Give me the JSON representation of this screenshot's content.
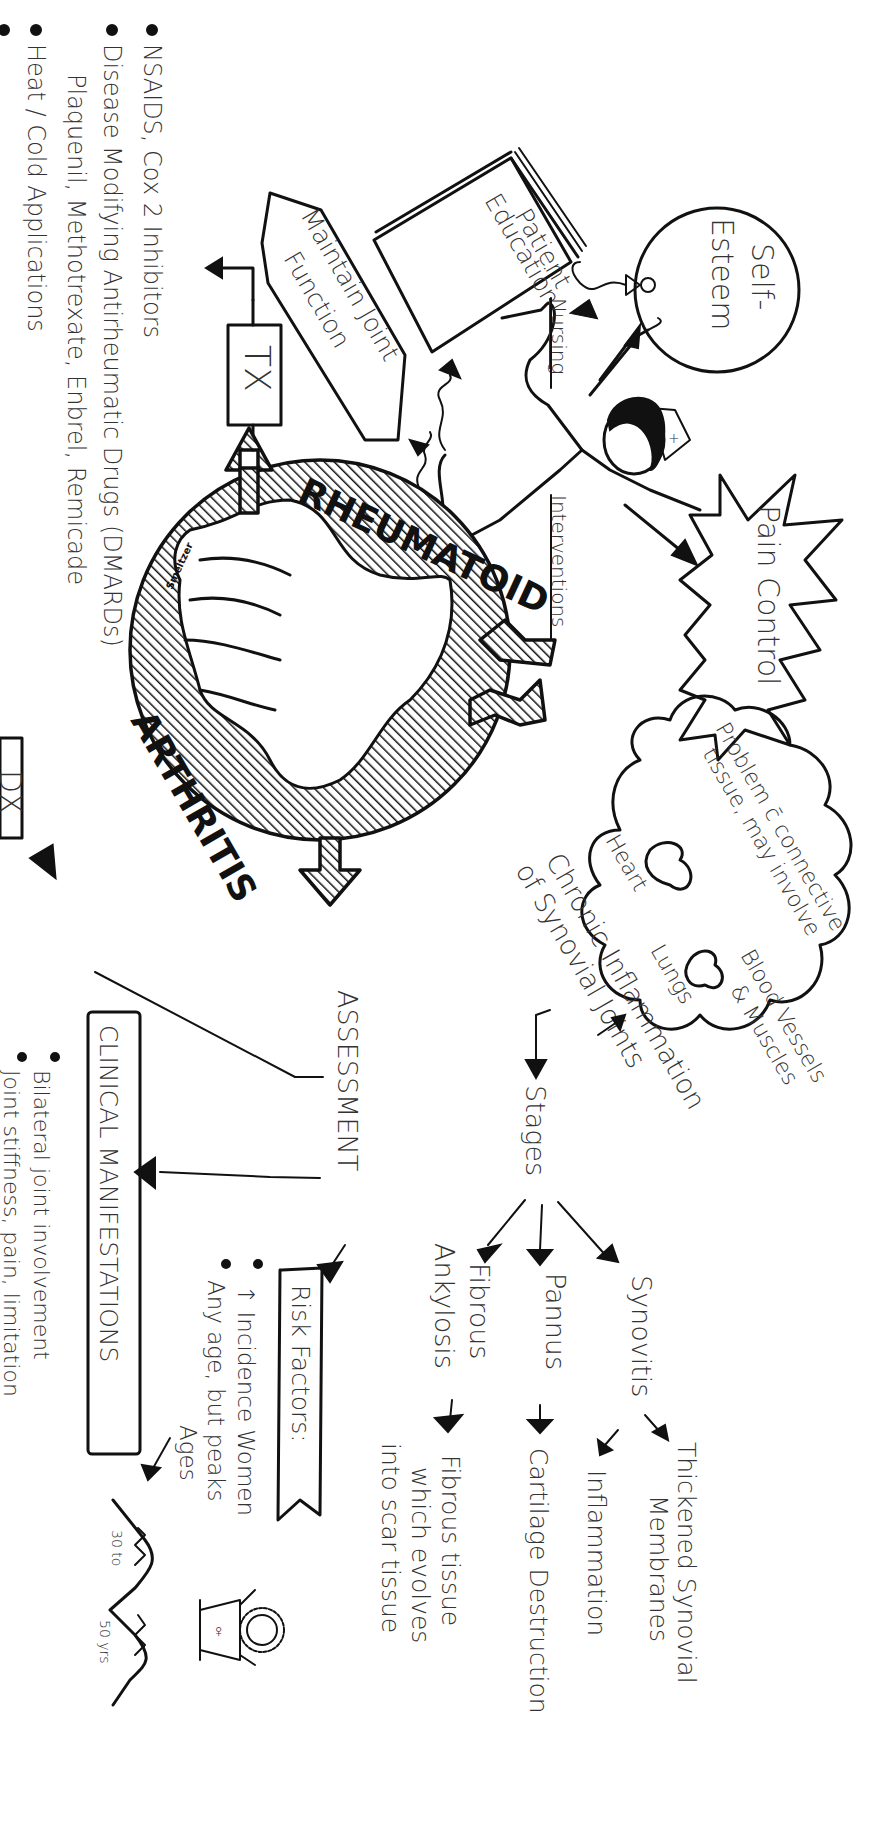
{
  "title": {
    "word1": "RHEUMATOID",
    "word2": "ARTHRITIS",
    "signature": "Smeltzer"
  },
  "treatment": {
    "box_label": "TX",
    "bullets": [
      "NSAIDS, Cox 2 Inhibitors",
      "Disease Modifying Antirheumatic Drugs (DMARDs)",
      "Plaquenil, Methotrexate, Enbrel, Remicade",
      "Heat / Cold Applications",
      "R... (partially visible, cut off)"
    ]
  },
  "nursing_interventions": {
    "label_top": "Nursing",
    "label_bottom": "Interventions",
    "goals": {
      "maintain_joint_function": "Maintain Joint Function",
      "patient_education": "Patient Education",
      "self_esteem": "Self-Esteem",
      "pain_control": "Pain Control"
    }
  },
  "pathophysiology": {
    "main": "Chronic Inflammation of Synovial Joints",
    "cloud": {
      "text": "Problem c̄ connective tissue, may involve",
      "organs": [
        "Heart",
        "Lungs",
        "Blood Vessels & Muscles"
      ]
    },
    "stages_label": "Stages",
    "stages": [
      {
        "name": "Synovitis",
        "results": [
          "Thickened Synovial Membranes",
          "Inflammation"
        ]
      },
      {
        "name": "Pannus",
        "results": [
          "Cartilage Destruction"
        ]
      },
      {
        "name": "Fibrous Ankylosis",
        "results": [
          "Fibrous tissue which evolves into scar tissue"
        ]
      }
    ]
  },
  "assessment": {
    "label": "ASSESSMENT",
    "dx_box": "DX",
    "clinical_manifestations": {
      "title": "CLINICAL MANIFESTATIONS",
      "bullets": [
        "Bilateral joint involvement",
        "Joint stiffness, pain, limitation"
      ]
    },
    "risk_factors": {
      "title": "Risk Factors:",
      "bullets": [
        "↑ Incidence Women",
        "Any age, but peaks"
      ],
      "ages_label": "Ages",
      "age_range_start": "30 to",
      "age_range_end": "50 yrs"
    }
  }
}
